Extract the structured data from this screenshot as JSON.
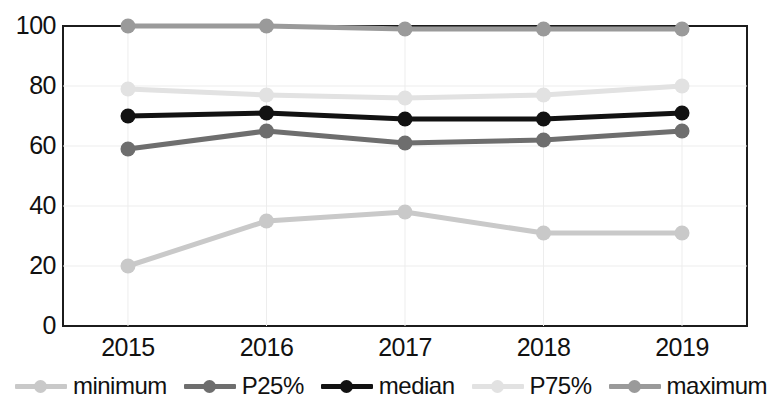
{
  "chart_data": {
    "type": "line",
    "title": "",
    "subtitle": "",
    "xlabel": "",
    "ylabel": "",
    "categories": [
      "2015",
      "2016",
      "2017",
      "2018",
      "2019"
    ],
    "x": [
      2015,
      2016,
      2017,
      2018,
      2019
    ],
    "ylim": [
      0,
      100
    ],
    "xlim": [
      2014.6,
      2019.4
    ],
    "yticks": [
      0,
      20,
      40,
      60,
      80,
      100
    ],
    "ytick_labels": [
      "0",
      "20",
      "40",
      "60",
      "80",
      "100"
    ],
    "xtick_labels": [
      "2015",
      "2016",
      "2017",
      "2018",
      "2019"
    ],
    "grid": true,
    "grid_color": "#ededed",
    "legend_position": "bottom",
    "markers": "circle",
    "series": [
      {
        "name": "minimum",
        "values": [
          20,
          35,
          38,
          31,
          31
        ],
        "color": "#c9c9c9"
      },
      {
        "name": "P25%",
        "values": [
          59,
          65,
          61,
          62,
          65
        ],
        "color": "#6e6e6e"
      },
      {
        "name": "median",
        "values": [
          70,
          71,
          69,
          69,
          71
        ],
        "color": "#121212"
      },
      {
        "name": "P75%",
        "values": [
          79,
          77,
          76,
          77,
          80
        ],
        "color": "#e2e2e2"
      },
      {
        "name": "maximum",
        "values": [
          100,
          100,
          99,
          99,
          99
        ],
        "color": "#9a9a9a"
      }
    ]
  },
  "axes": {
    "frame_color": "#1c1c1c"
  }
}
